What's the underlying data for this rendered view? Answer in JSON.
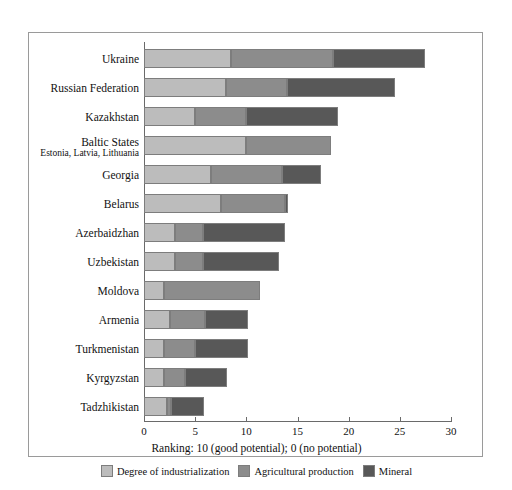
{
  "chart_data": {
    "type": "bar",
    "orientation": "horizontal",
    "stacked": true,
    "title": "",
    "xlabel": "Ranking: 10 (good potential); 0 (no potential)",
    "ylabel": "",
    "xlim": [
      0,
      30
    ],
    "xticks": [
      0,
      5,
      10,
      15,
      20,
      25,
      30
    ],
    "xtick_labels": [
      "0",
      "5",
      "10",
      "15",
      "20",
      "25",
      "30"
    ],
    "grid": false,
    "legend_position": "bottom",
    "categories": [
      "Ukraine",
      "Russian Federation",
      "Kazakhstan",
      "Baltic States",
      "Georgia",
      "Belarus",
      "Azerbaidzhan",
      "Uzbekistan",
      "Moldova",
      "Armenia",
      "Turkmenistan",
      "Kyrgyzstan",
      "Tadzhikistan"
    ],
    "category_sublabels": {
      "Baltic States": "Estonia, Latvia, Lithuania"
    },
    "series": [
      {
        "name": "Degree of industrialization",
        "color": "#bcbcbc",
        "values": [
          8.5,
          8.0,
          5.0,
          10.0,
          6.5,
          7.5,
          3.0,
          3.0,
          2.0,
          2.5,
          2.0,
          2.0,
          2.2
        ]
      },
      {
        "name": "Agricultural production",
        "color": "#8c8c8c",
        "values": [
          10.0,
          6.0,
          5.0,
          8.3,
          7.0,
          6.3,
          2.8,
          2.8,
          9.3,
          3.5,
          3.0,
          2.0,
          0.4
        ]
      },
      {
        "name": "Mineral",
        "color": "#585858",
        "values": [
          9.0,
          10.5,
          9.0,
          0.0,
          3.8,
          0.3,
          8.0,
          7.4,
          0.0,
          4.2,
          5.2,
          4.1,
          3.3
        ]
      }
    ],
    "totals": [
      27.5,
      24.5,
      19.0,
      18.3,
      17.3,
      14.1,
      13.8,
      13.2,
      11.3,
      10.2,
      10.2,
      8.1,
      5.9
    ]
  },
  "legend": {
    "items": [
      {
        "label": "Degree of industrialization",
        "swatch": "ind"
      },
      {
        "label": "Agricultural production",
        "swatch": "agr"
      },
      {
        "label": "Mineral",
        "swatch": "min"
      }
    ]
  }
}
